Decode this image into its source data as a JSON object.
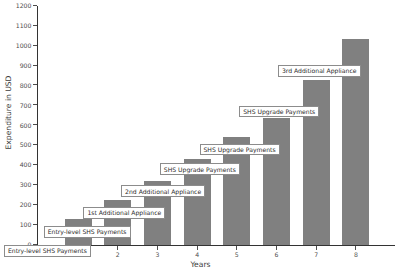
{
  "chart_data": {
    "type": "bar",
    "title": "",
    "xlabel": "Years",
    "ylabel": "Expenditure in USD",
    "categories": [
      "1",
      "2",
      "3",
      "4",
      "5",
      "6",
      "7",
      "8"
    ],
    "values": [
      130,
      225,
      320,
      430,
      540,
      640,
      830,
      1035
    ],
    "ylim": [
      0,
      1200
    ],
    "xlim": [
      0,
      8
    ],
    "y_ticks": [
      "0",
      "100",
      "200",
      "300",
      "400",
      "500",
      "600",
      "700",
      "800",
      "900",
      "1000",
      "1100",
      "1200"
    ],
    "x_ticks": [
      "1",
      "2",
      "3",
      "4",
      "5",
      "6",
      "7",
      "8"
    ],
    "grid": false,
    "legend": "none",
    "bar_color": "#808080",
    "annotations": [
      {
        "text": "Entry-level SHS Payments",
        "bar": 1
      },
      {
        "text": "Entry-level SHS Payments",
        "bar": 2
      },
      {
        "text": "1st Additional Appliance",
        "bar": 3
      },
      {
        "text": "2nd Additional Appliance",
        "bar": 4
      },
      {
        "text": "SHS Upgrade Payments",
        "bar": 5
      },
      {
        "text": "SHS Upgrade Payments",
        "bar": 6
      },
      {
        "text": "SHS Upgrade Payments",
        "bar": 7
      },
      {
        "text": "3rd Additional Appliance",
        "bar": 8
      }
    ]
  },
  "axes": {
    "y_title": "Expenditure in USD",
    "x_title": "Years",
    "y_tick_labels": [
      "1200",
      "1100",
      "1000",
      "900",
      "800",
      "700",
      "600",
      "500",
      "400",
      "300",
      "200",
      "100",
      "0"
    ],
    "x_tick_labels": [
      "1",
      "2",
      "3",
      "4",
      "5",
      "6",
      "7",
      "8"
    ]
  },
  "annotation_labels": [
    "Entry-level SHS Payments",
    "Entry-level SHS Payments",
    "1st Additional Appliance",
    "2nd Additional Appliance",
    "SHS Upgrade Payments",
    "SHS Upgrade Payments",
    "SHS Upgrade Payments",
    "3rd Additional Appliance"
  ]
}
